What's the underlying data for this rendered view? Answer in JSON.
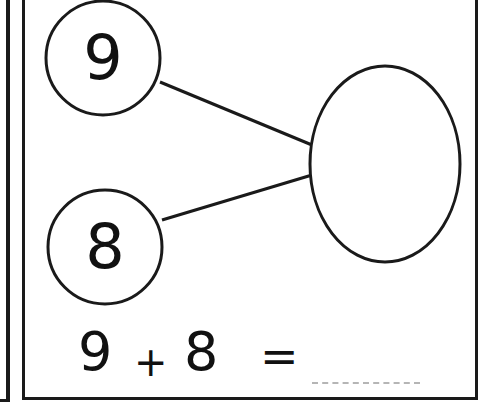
{
  "worksheet": {
    "top_number": "9",
    "bottom_number": "8",
    "sum_placeholder": "",
    "equation": {
      "left_operand": "9",
      "operator": "+",
      "right_operand": "8",
      "equals": "=",
      "answer_blank": ""
    }
  },
  "colors": {
    "ink": "#111111",
    "blank_line": "#b5b5b5",
    "background": "#ffffff"
  }
}
